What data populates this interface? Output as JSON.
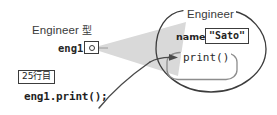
{
  "diagram": {
    "colors": {
      "stroke": "#3c3c3c",
      "cone_fill": "#d9d9d9",
      "arrow": "#4a4a4a",
      "background": "#ffffff",
      "text": "#2b2b2b"
    },
    "variable": {
      "type_label": "Engineer ",
      "type_suffix_jp": "型",
      "name": "eng1",
      "pointer_box_name": "pointer-cell"
    },
    "code": {
      "line_badge": "25行目",
      "statement": "eng1.print();"
    },
    "object": {
      "class_name": "Engineer",
      "field": {
        "name": "name",
        "value": "\"Sato\""
      },
      "method": {
        "name": "print()"
      }
    }
  }
}
